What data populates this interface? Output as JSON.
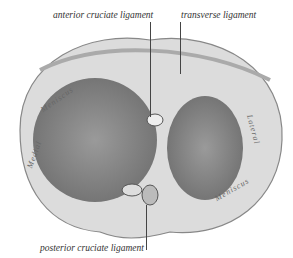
{
  "labels": {
    "anterior": "anterior cruciate ligament",
    "transverse": "transverse ligament",
    "posterior": "posterior cruciate ligament",
    "medial_1": "Medial",
    "medial_2": "Meniscus",
    "lateral_1": "Lateral",
    "lateral_2": "Meniscus"
  }
}
